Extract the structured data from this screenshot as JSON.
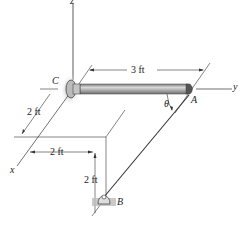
{
  "figure": {
    "labels": {
      "z_axis": "z",
      "y_axis": "y",
      "x_axis": "x",
      "point_c": "C",
      "point_a": "A",
      "point_b": "B",
      "angle": "θ"
    },
    "dimensions": {
      "rod_length": "3 ft",
      "x_offset": "2 ft",
      "y_offset": "2 ft",
      "z_offset": "2 ft"
    },
    "colors": {
      "line": "#333333",
      "rod_fill": "#9a9a9a",
      "rod_highlight": "#d0d0d0",
      "support_shadow": "#bdbdbd"
    }
  }
}
